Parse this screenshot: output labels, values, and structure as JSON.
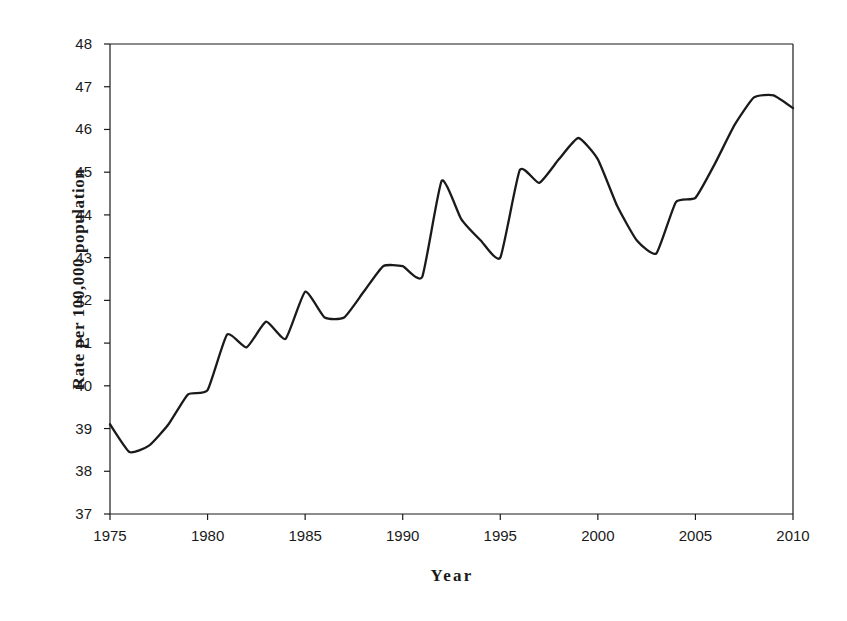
{
  "chart_data": {
    "type": "line",
    "title": "",
    "xlabel": "Year",
    "ylabel": "Rate per 100,000 population",
    "xlim": [
      1975,
      2010
    ],
    "ylim": [
      37,
      48
    ],
    "grid": false,
    "legend": null,
    "xticks": [
      "1975",
      "1980",
      "1985",
      "1990",
      "1995",
      "2000",
      "2005",
      "2010"
    ],
    "xtick_values": [
      1975,
      1980,
      1985,
      1990,
      1995,
      2000,
      2005,
      2010
    ],
    "yticks": [
      "37",
      "38",
      "39",
      "40",
      "41",
      "42",
      "43",
      "44",
      "45",
      "46",
      "47",
      "48"
    ],
    "ytick_values": [
      37,
      38,
      39,
      40,
      41,
      42,
      43,
      44,
      45,
      46,
      47,
      48
    ],
    "series": [
      {
        "name": "Rate per 100,000 population",
        "color": "#1a1a1a",
        "x": [
          1975,
          1976,
          1977,
          1978,
          1979,
          1980,
          1981,
          1982,
          1983,
          1984,
          1985,
          1986,
          1987,
          1988,
          1989,
          1990,
          1991,
          1992,
          1993,
          1994,
          1995,
          1996,
          1997,
          1998,
          1999,
          2000,
          2001,
          2002,
          2003,
          2004,
          2005,
          2006,
          2007,
          2008,
          2009,
          2010
        ],
        "values": [
          39.1,
          38.45,
          38.6,
          39.1,
          39.8,
          39.9,
          41.2,
          40.9,
          41.5,
          41.1,
          42.2,
          41.6,
          41.6,
          42.2,
          42.8,
          42.8,
          42.55,
          44.8,
          43.9,
          43.4,
          43.0,
          45.05,
          44.75,
          45.3,
          45.8,
          45.3,
          44.2,
          43.4,
          43.1,
          44.3,
          44.4,
          45.2,
          46.1,
          46.75,
          46.8,
          46.5
        ]
      }
    ]
  },
  "axes": {
    "x_axis_name": "year-axis",
    "y_axis_name": "rate-axis"
  }
}
